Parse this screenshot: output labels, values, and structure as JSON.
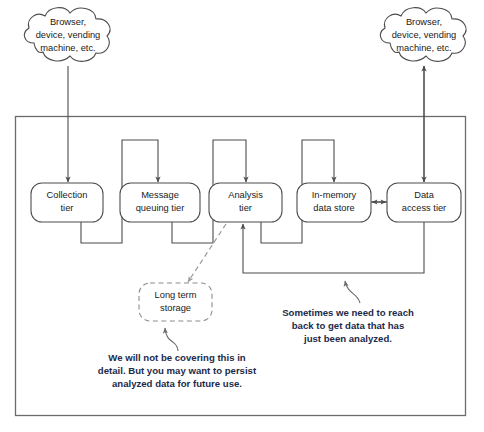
{
  "diagram": {
    "clouds": [
      {
        "id": "cloud-left",
        "lines": [
          "Browser,",
          "device, vending",
          "machine, etc."
        ]
      },
      {
        "id": "cloud-right",
        "lines": [
          "Browser,",
          "device, vending",
          "machine, etc."
        ]
      }
    ],
    "nodes": [
      {
        "id": "collection-tier",
        "lines": [
          "Collection",
          "tier"
        ],
        "style": "solid"
      },
      {
        "id": "message-queuing-tier",
        "lines": [
          "Message",
          "queuing tier"
        ],
        "style": "solid"
      },
      {
        "id": "analysis-tier",
        "lines": [
          "Analysis",
          "tier"
        ],
        "style": "solid"
      },
      {
        "id": "in-memory-data-store",
        "lines": [
          "In-memory",
          "data store"
        ],
        "style": "solid"
      },
      {
        "id": "data-access-tier",
        "lines": [
          "Data",
          "access tier"
        ],
        "style": "solid"
      },
      {
        "id": "long-term-storage",
        "lines": [
          "Long term",
          "storage"
        ],
        "style": "dashed"
      }
    ],
    "callouts": [
      {
        "id": "callout-long-term-storage",
        "lines": [
          "We will not be covering this in",
          "detail. But you may want to persist",
          "analyzed data for future use."
        ]
      },
      {
        "id": "callout-feedback-loop",
        "lines": [
          "Sometimes we need to reach",
          "back to get data that has",
          "just been analyzed."
        ]
      }
    ],
    "colors": {
      "stroke": "#4d4d4d",
      "dashed_stroke": "#9a9a9a",
      "container_stroke": "#6b6b6b",
      "callout_text": "#1b2a4a",
      "node_text": "#1a1a1a",
      "background": "#ffffff"
    }
  }
}
